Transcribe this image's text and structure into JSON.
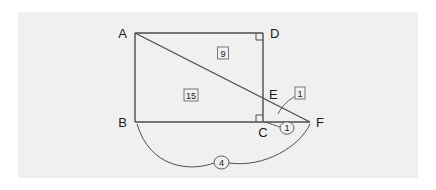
{
  "figure": {
    "type": "geometry-diagram",
    "background_color": "#f0f0f0",
    "page_color": "#ffffff",
    "line_color": "#4d4d4d",
    "vertices": [
      {
        "id": "A",
        "label": "A",
        "x": 135,
        "y": 33,
        "label_x": 127,
        "label_y": 38,
        "anchor": "end"
      },
      {
        "id": "D",
        "label": "D",
        "x": 263,
        "y": 33,
        "label_x": 270,
        "label_y": 38,
        "anchor": "start"
      },
      {
        "id": "B",
        "label": "B",
        "x": 135,
        "y": 122,
        "label_x": 127,
        "label_y": 127,
        "anchor": "end"
      },
      {
        "id": "C",
        "label": "C",
        "x": 263,
        "y": 122,
        "label_x": 263,
        "label_y": 136,
        "anchor": "middle"
      },
      {
        "id": "E",
        "label": "E",
        "x": 263,
        "y": 96,
        "label_x": 269,
        "label_y": 97,
        "anchor": "start"
      },
      {
        "id": "F",
        "label": "F",
        "x": 310,
        "y": 122,
        "label_x": 316,
        "label_y": 127,
        "anchor": "start"
      }
    ],
    "segments": [
      {
        "name": "side-AD",
        "from": "A",
        "to": "D"
      },
      {
        "name": "side-AB",
        "from": "A",
        "to": "B"
      },
      {
        "name": "side-BC",
        "from": "B",
        "to": "C"
      },
      {
        "name": "side-DC",
        "from": "D",
        "to": "C"
      },
      {
        "name": "diagonal-A-to-F",
        "from": "A",
        "to": "F"
      },
      {
        "name": "base-C-to-F",
        "from": "C",
        "to": "F"
      }
    ],
    "right_angles": [
      {
        "name": "right-angle-at-D",
        "x": 263,
        "y": 33,
        "dir_x": -1,
        "dir_y": 1,
        "size": 7
      },
      {
        "name": "right-angle-at-C",
        "x": 263,
        "y": 122,
        "dir_x": -1,
        "dir_y": -1,
        "size": 7
      }
    ],
    "boxed_labels": [
      {
        "name": "label-9",
        "text": "9",
        "x": 223,
        "y": 53,
        "width": 11,
        "height": 12
      },
      {
        "name": "label-15",
        "text": "15",
        "x": 191,
        "y": 95,
        "width": 14,
        "height": 12
      },
      {
        "name": "label-1-boxed",
        "text": "1",
        "x": 300,
        "y": 93,
        "width": 10,
        "height": 12
      }
    ],
    "circled_labels": [
      {
        "name": "label-1-circled",
        "text": "1",
        "x": 287,
        "y": 128,
        "rx": 7,
        "ry": 6
      },
      {
        "name": "label-4-circled",
        "text": "4",
        "x": 221,
        "y": 162,
        "rx": 7.5,
        "ry": 6.5
      }
    ],
    "leaders": [
      {
        "name": "leader-to-boxed-1",
        "path": "M 296 95 C 290 98 282 104 278 114"
      },
      {
        "name": "leader-to-circled-1",
        "path": "M 280 128 C 274 126 270 124 266 122"
      }
    ],
    "arcs": [
      {
        "name": "arc-B-to-F-left",
        "path": "M 137 124 C 150 168 190 172 214 163"
      },
      {
        "name": "arc-B-to-F-right",
        "path": "M 229 163 C 265 168 300 146 310 124"
      }
    ]
  }
}
